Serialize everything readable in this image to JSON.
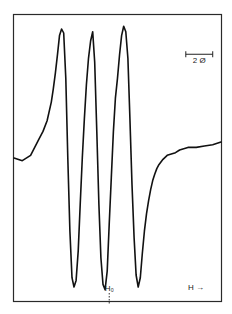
{
  "chart_data": {
    "type": "line",
    "title": "",
    "xlabel": "H",
    "ylabel": "",
    "x_direction_label": "H →",
    "center_marker_label": "H₀",
    "scale_bar_label": "2 Ø",
    "grid": false,
    "legend": "none",
    "xlim": [
      0,
      100
    ],
    "ylim": [
      -1,
      1
    ],
    "center_marker_x": 46,
    "scale_bar": {
      "x_start": 83,
      "x_end": 96,
      "y": 0.78
    },
    "series": [
      {
        "name": "derivative spectrum",
        "x": [
          0,
          4,
          8,
          10,
          12,
          14,
          16,
          18,
          19,
          20,
          21,
          22,
          23,
          24,
          25,
          26,
          27,
          28,
          29,
          30,
          31,
          32,
          33,
          34,
          35,
          36,
          37,
          38,
          39,
          40,
          41,
          42,
          43,
          44,
          45,
          46,
          47,
          48,
          49,
          50,
          51,
          52,
          53,
          54,
          55,
          56,
          57,
          58,
          59,
          60,
          61,
          62,
          63,
          64,
          65,
          66,
          67,
          68,
          69,
          70,
          72,
          74,
          76,
          78,
          80,
          84,
          88,
          92,
          96,
          100
        ],
        "y": [
          0.0,
          -0.02,
          0.02,
          0.08,
          0.14,
          0.2,
          0.28,
          0.42,
          0.52,
          0.64,
          0.78,
          0.92,
          0.97,
          0.94,
          0.6,
          0.0,
          -0.55,
          -0.9,
          -0.97,
          -0.92,
          -0.7,
          -0.35,
          0.0,
          0.3,
          0.55,
          0.75,
          0.88,
          0.95,
          0.72,
          0.2,
          -0.35,
          -0.75,
          -0.95,
          -0.99,
          -0.85,
          -0.5,
          -0.15,
          0.2,
          0.45,
          0.6,
          0.78,
          0.92,
          0.99,
          0.95,
          0.75,
          0.3,
          -0.2,
          -0.6,
          -0.88,
          -0.97,
          -0.9,
          -0.72,
          -0.55,
          -0.42,
          -0.32,
          -0.24,
          -0.17,
          -0.12,
          -0.08,
          -0.05,
          -0.01,
          0.02,
          0.03,
          0.04,
          0.06,
          0.08,
          0.08,
          0.09,
          0.1,
          0.12
        ]
      }
    ]
  }
}
